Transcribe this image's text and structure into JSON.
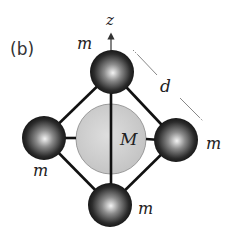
{
  "figure": {
    "panel_label": "(b)",
    "axis_label": "z",
    "central_mass_label": "M",
    "distance_label": "d",
    "outer_mass_labels": {
      "top": "m",
      "right": "m",
      "left": "m",
      "bottom": "m"
    }
  },
  "colors": {
    "outer_sphere_dark": "#111111",
    "outer_sphere_highlight": "#f2f2f2",
    "central_sphere_fill": "#cfcfcf",
    "rod": "#111111",
    "dimension_line": "#888888"
  }
}
